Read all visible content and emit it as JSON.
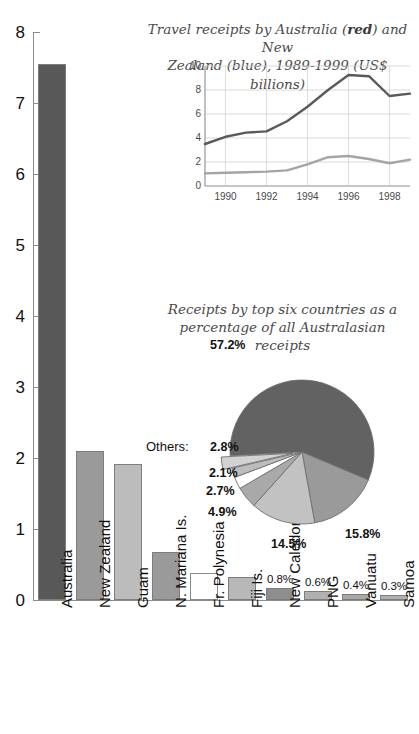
{
  "chart_data": [
    {
      "type": "bar",
      "id": "main-bar-chart",
      "title": "",
      "xlabel": "",
      "ylabel": "",
      "ylim": [
        0,
        8
      ],
      "yticks": [
        0,
        1,
        2,
        3,
        4,
        5,
        6,
        7,
        8
      ],
      "ytick_labels": [
        "0",
        "1",
        "2",
        "3",
        "4",
        "5",
        "6",
        "7",
        "8"
      ],
      "grid": false,
      "units": "US$ billions",
      "categories": [
        "Australia",
        "New Zealand",
        "Guam",
        "N. Mariana Is.",
        "Fr. Polynesia",
        "Fiji Is.",
        "New Caledonia",
        "PNG",
        "Vanuatu",
        "Samoa"
      ],
      "values": [
        7.55,
        2.1,
        1.92,
        0.68,
        0.38,
        0.32,
        0.17,
        0.13,
        0.09,
        0.07
      ],
      "bar_colors": [
        "#585858",
        "#9a9a9a",
        "#bcbcbc",
        "#9a9a9a",
        "#ffffff",
        "#b8b8b8",
        "#8e8e8e",
        "#b0b0b0",
        "#a8a8a8",
        "#b0b0b0"
      ],
      "data_labels": [
        "",
        "",
        "",
        "",
        "",
        "",
        "0.8%",
        "0.6%",
        "0.4%",
        "0.3%"
      ]
    },
    {
      "type": "line",
      "id": "inset-line-chart",
      "title_parts": {
        "line1_a": "Travel receipts by Australia (",
        "line1_red": "red",
        "line1_b": ") and New",
        "line2_a": "Zealand (",
        "line2_blue": "blue",
        "line2_b": "), 1989-1999 (US$ billions)"
      },
      "xlabel": "",
      "ylabel": "",
      "ylim": [
        0,
        10
      ],
      "yticks": [
        0,
        2,
        4,
        6,
        8,
        10
      ],
      "ytick_labels": [
        "0",
        "2",
        "4",
        "6",
        "8",
        "10"
      ],
      "xlim": [
        1989,
        1999
      ],
      "xticks": [
        1990,
        1992,
        1994,
        1996,
        1998
      ],
      "xtick_labels": [
        "1990",
        "1992",
        "1994",
        "1996",
        "1998"
      ],
      "grid": true,
      "x": [
        1989,
        1990,
        1991,
        1992,
        1993,
        1994,
        1995,
        1996,
        1997,
        1998,
        1999
      ],
      "series": [
        {
          "name": "Australia",
          "color": "#5a5a5a",
          "legend_word": "red",
          "values": [
            3.5,
            4.1,
            4.45,
            4.55,
            5.4,
            6.6,
            8.0,
            9.25,
            9.15,
            7.5,
            7.7
          ]
        },
        {
          "name": "New Zealand",
          "color": "#a5a5a5",
          "legend_word": "blue",
          "values": [
            1.05,
            1.1,
            1.15,
            1.2,
            1.3,
            1.8,
            2.4,
            2.5,
            2.25,
            1.9,
            2.2
          ]
        }
      ]
    },
    {
      "type": "pie",
      "id": "inset-pie-chart",
      "title_line1": "Receipts by top six countries as a",
      "title_line2": "percentage of all Australasian receipts",
      "others_label": "Others:",
      "labels": [
        "57.2%",
        "15.8%",
        "14.5%",
        "4.9%",
        "2.7%",
        "2.1%",
        "2.8%"
      ],
      "values": [
        57.2,
        15.8,
        14.5,
        4.9,
        2.7,
        2.1,
        2.8
      ],
      "slice_colors": [
        "#626262",
        "#9a9a9a",
        "#c2c2c2",
        "#a9a9a9",
        "#ffffff",
        "#bdbdbd",
        "#d2d2d2"
      ],
      "exploded": [
        false,
        false,
        false,
        false,
        false,
        false,
        true
      ]
    }
  ],
  "colors": {
    "axis": "#8d8d8d",
    "text": "#111111",
    "title_text": "#4a4a4a",
    "grid": "#cfcfcf",
    "background": "#ffffff"
  }
}
